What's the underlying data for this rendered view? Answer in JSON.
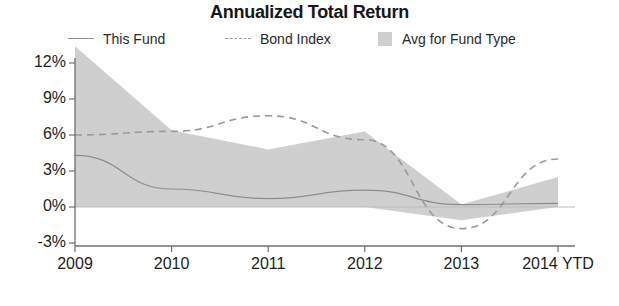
{
  "chart_data": {
    "type": "area",
    "title": "Annualized Total Return",
    "xlabel": "",
    "ylabel": "",
    "grid": false,
    "legend_position": "top",
    "categories": [
      "2009",
      "2010",
      "2011",
      "2012",
      "2013",
      "2014 YTD"
    ],
    "x_tick_labels": [
      "2009",
      "2010",
      "2011",
      "2012",
      "2013",
      "2014 YTD"
    ],
    "y_tick_labels": [
      "12%",
      "9%",
      "6%",
      "3%",
      "0%",
      "-3%"
    ],
    "y_ticks": [
      12,
      9,
      6,
      3,
      0,
      -3
    ],
    "ylim": [
      -3,
      13.5
    ],
    "y_unit": "%",
    "series": [
      {
        "name": "This Fund",
        "style": "solid",
        "color": "#8d8d8d",
        "values": [
          4.3,
          1.5,
          0.7,
          1.4,
          0.2,
          0.3
        ]
      },
      {
        "name": "Bond Index",
        "style": "dashed",
        "color": "#9a9a9a",
        "values": [
          6.0,
          6.3,
          7.6,
          5.6,
          -1.8,
          4.0
        ]
      },
      {
        "name": "Avg for Fund Type",
        "style": "band",
        "color": "#cfcfcf",
        "band_upper": [
          13.4,
          6.4,
          4.8,
          6.3,
          0.2,
          2.5
        ],
        "band_lower": [
          0.0,
          0.0,
          0.0,
          0.0,
          -1.1,
          0.0
        ]
      }
    ]
  },
  "legend": {
    "this_fund": "This Fund",
    "bond_index": "Bond Index",
    "avg_for_fund_type": "Avg for Fund Type"
  },
  "colors": {
    "band_fill": "#cfcfcf",
    "this_fund_line": "#8d8d8d",
    "bond_index_line": "#9a9a9a",
    "axis": "#6f6f6f",
    "text": "#1a1a1a"
  }
}
